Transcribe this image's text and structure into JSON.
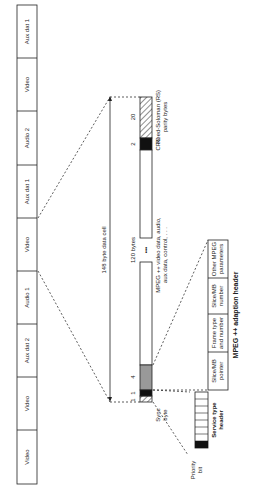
{
  "diagram": {
    "stream_cells": [
      "Aux dat 1",
      "Video",
      "Audio 2",
      "Aux dat 1",
      "Video",
      "Audio 1",
      "Aux dat 2",
      "Video",
      "Video"
    ],
    "cell_size_label": "148 byte data cell",
    "segments": {
      "sync_count": "1",
      "service_count": "1",
      "adaption_count": "4",
      "payload_label": "120 bytes",
      "ellipsis": "•••",
      "crc_count": "2",
      "rs_count": "20"
    },
    "labels": {
      "payload_desc_line1": "MPEG ++ video data, audio,",
      "payload_desc_line2": "aux data, control, . . .",
      "crc": "CRC",
      "rs_line1": "Reed-Soloman (RS)",
      "rs_line2": "parity bytes",
      "sync_line1": "Sync",
      "sync_line2": "byte",
      "priority_line1": "Priority",
      "priority_line2": "bit",
      "service_header_line1": "Service type",
      "service_header_line2": "header",
      "adaption_header_title": "MPEG ++ adaption header"
    },
    "adaption_fields": [
      {
        "line1": "Slice/MB",
        "line2": "pointer"
      },
      {
        "line1": "Frame type",
        "line2": "and number"
      },
      {
        "line1": "Slice/MB",
        "line2": "number"
      },
      {
        "line1": "Other MPEG",
        "line2": "parameters"
      }
    ]
  }
}
